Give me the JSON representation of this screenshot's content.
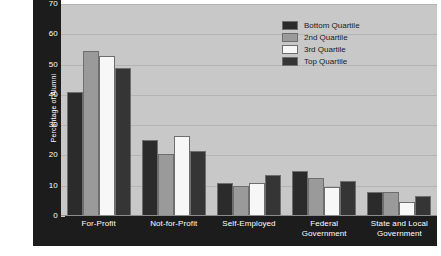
{
  "chart_data": {
    "type": "bar",
    "title": "",
    "xlabel": "",
    "ylabel": "Percentage of Alumni",
    "ylim": [
      0,
      70
    ],
    "yticks": [
      0,
      10,
      20,
      30,
      40,
      50,
      60,
      70
    ],
    "ytick_labels": [
      "0",
      "10",
      "20",
      "30",
      "40",
      "50",
      "60",
      "70"
    ],
    "grid": true,
    "legend_position": "top-right",
    "categories": [
      "For-Profit",
      "Not-for-Profit",
      "Self-Employed",
      "Federal Government",
      "State and Local Government"
    ],
    "category_lines": [
      [
        "For-Profit"
      ],
      [
        "Not-for-Profit"
      ],
      [
        "Self-Employed"
      ],
      [
        "Federal",
        "Government"
      ],
      [
        "State and Local",
        "Government"
      ]
    ],
    "series": [
      {
        "name": "Bottom Quartile",
        "color": "#2b2b2b",
        "values": [
          41,
          25,
          11,
          15,
          8
        ]
      },
      {
        "name": "2nd Quartile",
        "color": "#9a9a9a",
        "values": [
          54.5,
          20.5,
          10,
          12.5,
          8
        ]
      },
      {
        "name": "3rd Quartile",
        "color": "#f7f7f7",
        "values": [
          53,
          26.5,
          11,
          9.5,
          4.5
        ]
      },
      {
        "name": "Top Quartile",
        "color": "#353535",
        "values": [
          49,
          21.5,
          13.5,
          11.5,
          6.5
        ]
      }
    ],
    "colors": {
      "plot_background": "#c8c8c8",
      "frame": "#1c1c1c",
      "gridline": "#b4b4b4",
      "tick_text": "#ffffff",
      "legend_text": "#1a1a1a",
      "page_background": "#ffffff"
    }
  },
  "legend": {
    "items": [
      {
        "label": "Bottom Quartile",
        "color": "#2b2b2b"
      },
      {
        "label": "2nd Quartile",
        "color": "#9a9a9a"
      },
      {
        "label": "3rd Quartile",
        "color": "#f7f7f7"
      },
      {
        "label": "Top Quartile",
        "color": "#353535"
      }
    ]
  }
}
